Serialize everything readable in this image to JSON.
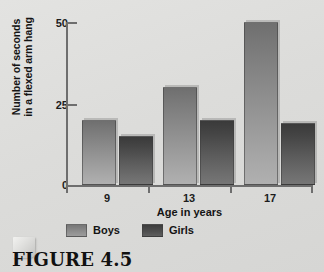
{
  "figure": {
    "caption": "FIGURE 4.5",
    "page_curl_icon": "page-curl-icon"
  },
  "chart_data": {
    "type": "bar",
    "title": "",
    "categories": [
      "9",
      "13",
      "17"
    ],
    "series": [
      {
        "name": "Boys",
        "values": [
          20,
          30,
          50
        ],
        "color": "#8e8e8e"
      },
      {
        "name": "Girls",
        "values": [
          15,
          20,
          19
        ],
        "color": "#4f4f4f"
      }
    ],
    "xlabel": "Age in years",
    "ylabel_line1": "Number of seconds",
    "ylabel_line2": "in a flexed arm hang",
    "ylim": [
      0,
      50
    ],
    "yticks": [
      0,
      25,
      50
    ],
    "ytick_labels": [
      "0",
      "25",
      "50"
    ],
    "grid": false,
    "legend_position": "bottom-left",
    "legend_entries": [
      "Boys",
      "Girls"
    ],
    "background_color": "#dcdcda",
    "axis_color": "#6e6e6e"
  }
}
